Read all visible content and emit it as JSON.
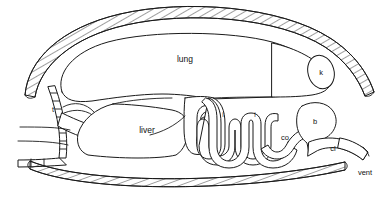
{
  "figure": {
    "background_color": "#ffffff",
    "line_color": "#1a1a1a"
  },
  "labels": {
    "lung": "lung",
    "kidney": "k",
    "trachea": "t",
    "esophagus": "esophagus",
    "heart": "heart",
    "liver": "liver",
    "stomach": "s",
    "intestine_1": "i",
    "intestine_2": "i",
    "colon": "co",
    "bladder": "b",
    "cloaca": "cl",
    "vent": "vent"
  }
}
